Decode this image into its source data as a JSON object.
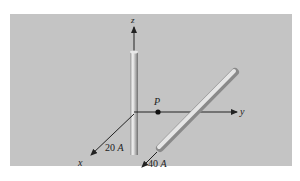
{
  "figure": {
    "axes": {
      "x": "x",
      "y": "y",
      "z": "z"
    },
    "point": {
      "label": "P"
    },
    "wires": [
      {
        "id": "vertical",
        "current": "20",
        "unit": "A",
        "direction": "along z-axis"
      },
      {
        "id": "diagonal",
        "current": "40",
        "unit": "A",
        "direction": "parallel to x-axis, offset along y"
      }
    ],
    "colors": {
      "background": "#c4c4c4",
      "wire_light": "#f0f0f0",
      "wire_dark": "#8a8a8a",
      "axis": "#222222"
    }
  }
}
